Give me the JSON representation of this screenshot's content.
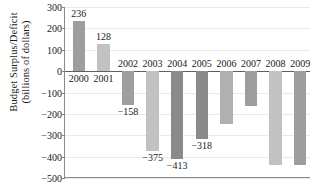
{
  "chart_data": {
    "type": "bar",
    "title": "",
    "subtitle": "",
    "xlabel": "",
    "ylabel": "Budget Surplus/Deficit (billions of dollars)",
    "ylabel_lines": [
      "Budget Surplus/Deficit",
      "(billions of dollars)"
    ],
    "categories": [
      "2000",
      "2001",
      "2002",
      "2003",
      "2004",
      "2005",
      "2006",
      "2007",
      "2008",
      "2009"
    ],
    "values": [
      236,
      128,
      -158,
      -375,
      -413,
      -318,
      -248,
      -161,
      -438,
      -438
    ],
    "data_labels": [
      "236",
      "128",
      "−158",
      "−375",
      "−413",
      "−318",
      "",
      "",
      "",
      ""
    ],
    "bar_colors": [
      "#9e9e9e",
      "#c2c2c2",
      "#9e9e9e",
      "#c2c2c2",
      "#8a8a8a",
      "#8a8a8a",
      "#b0b0b0",
      "#9e9e9e",
      "#c2c2c2",
      "#9e9e9e"
    ],
    "ylim": [
      -500,
      300
    ],
    "yticks": [
      300,
      200,
      100,
      0,
      -100,
      -200,
      -300,
      -400,
      -500
    ],
    "ytick_labels": [
      "300",
      "200",
      "100",
      "0",
      "−100",
      "−200",
      "−300",
      "−400",
      "−500"
    ],
    "grid": true,
    "grid_axis": "y",
    "legend": "none",
    "axis_color": "#8a8a8a",
    "grid_color": "#e9e9e9",
    "zero_line_color": "#5f5f5f",
    "text_color": "#1a1a1a",
    "background": "#ffffff"
  }
}
